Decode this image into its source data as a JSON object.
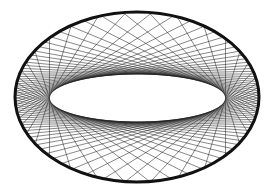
{
  "figure": {
    "width": 275,
    "height": 196,
    "background": "#ffffff",
    "outer_ellipse": {
      "cx": 137,
      "cy": 97,
      "rx": 122,
      "ry": 85,
      "stroke": "#111111",
      "stroke_width": 3
    },
    "inner_ellipse": {
      "cx": 137.5,
      "cy": 98,
      "rx": 88,
      "ry": 24
    },
    "chords": {
      "count": 76,
      "stroke": "#222222",
      "stroke_width": 0.6,
      "opacity": 0.9
    }
  }
}
